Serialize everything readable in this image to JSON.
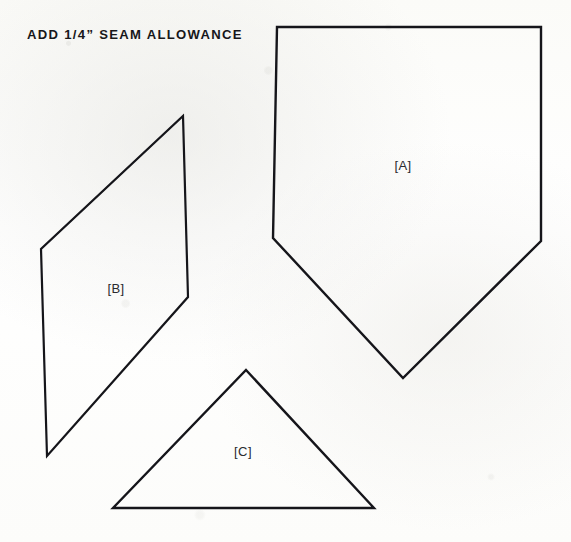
{
  "sheet": {
    "heading": "ADD 1/4” SEAM ALLOWANCE",
    "background_color": "#fdfdfb",
    "ink_color": "#15151a",
    "width": 571,
    "height": 542
  },
  "pieces": [
    {
      "id": "A",
      "label": "[A]",
      "shape": "pentagon",
      "stroke_width": 2.4,
      "points": "277,27 541,27 541,241 403,378 273,238",
      "label_x": 403,
      "label_y": 165
    },
    {
      "id": "B",
      "label": "[B]",
      "shape": "parallelogram",
      "stroke_width": 2.2,
      "points": "183,116 188,297 47,456 41,249",
      "label_x": 116,
      "label_y": 288
    },
    {
      "id": "C",
      "label": "[C]",
      "shape": "triangle",
      "stroke_width": 2.4,
      "points": "246,370 374,508 113,508",
      "label_x": 243,
      "label_y": 451
    }
  ]
}
